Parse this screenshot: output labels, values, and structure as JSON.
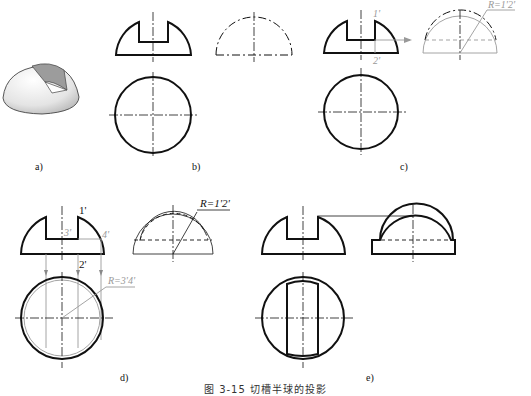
{
  "figure": {
    "caption": "图 3-15   切槽半球的投影",
    "panels": [
      {
        "id": "a",
        "label": "a)"
      },
      {
        "id": "b",
        "label": "b)"
      },
      {
        "id": "c",
        "label": "c)"
      },
      {
        "id": "d",
        "label": "d)"
      },
      {
        "id": "e",
        "label": "e)"
      }
    ],
    "annotations": {
      "c": {
        "point_top": "1'",
        "point_bottom": "2'",
        "radius": "R=1'2'"
      },
      "d": {
        "point_1": "1'",
        "point_2": "2'",
        "point_3": "3'",
        "point_4": "4'",
        "radius_side": "R=1'2'",
        "radius_top": "R=3'4'"
      }
    },
    "colors": {
      "line": "#111111",
      "construction": "#9a9a9a",
      "shade_dark": "#9c9c9c",
      "shade_light": "#e6e6e6"
    }
  }
}
